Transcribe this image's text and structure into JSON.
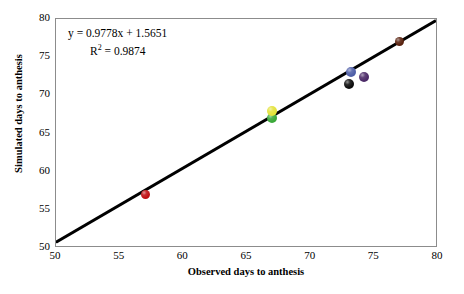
{
  "chart_data": {
    "type": "scatter",
    "title": "",
    "xlabel": "Observed days to anthesis",
    "ylabel": "Simulated days to anthesis",
    "xlim": [
      50,
      80
    ],
    "ylim": [
      50,
      80
    ],
    "xticks": [
      50,
      55,
      60,
      65,
      70,
      75,
      80
    ],
    "yticks": [
      50,
      55,
      60,
      65,
      70,
      75,
      80
    ],
    "grid": false,
    "legend": null,
    "annotations": {
      "equation": "y = 0.9778x + 1.5651",
      "r_squared_prefix": "R",
      "r_squared_sup": "2",
      "r_squared_value": " = 0.9874"
    },
    "fit_line": {
      "slope": 0.9778,
      "intercept": 1.5651,
      "x_start": 50,
      "y_start": 50.5,
      "x_end": 80,
      "y_end": 79.8,
      "color": "#000000",
      "width_px": 3
    },
    "points": [
      {
        "name": "red-point",
        "x": 57.0,
        "y": 57.0,
        "color": "#c00f13",
        "size": 9
      },
      {
        "name": "green-point",
        "x": 67.0,
        "y": 67.0,
        "color": "#3aa838",
        "size": 10
      },
      {
        "name": "yellow-point",
        "x": 67.0,
        "y": 67.9,
        "color": "#e3e23a",
        "size": 10
      },
      {
        "name": "black-point",
        "x": 73.0,
        "y": 71.5,
        "color": "#0d0d0d",
        "size": 10
      },
      {
        "name": "blue-point",
        "x": 73.2,
        "y": 73.1,
        "color": "#4f5fa8",
        "size": 10
      },
      {
        "name": "purple-point",
        "x": 74.2,
        "y": 72.4,
        "color": "#4b2a67",
        "size": 10
      },
      {
        "name": "dark-brown-point",
        "x": 77.0,
        "y": 77.0,
        "color": "#5a2310",
        "size": 9
      }
    ]
  },
  "axes": {
    "x_title": "Observed days to anthesis",
    "y_title": "Simulated days to anthesis",
    "x_tick_labels": [
      "50",
      "55",
      "60",
      "65",
      "70",
      "75",
      "80"
    ],
    "y_tick_labels": [
      "50",
      "55",
      "60",
      "65",
      "70",
      "75",
      "80"
    ]
  },
  "colors": {
    "frame": "#8c8c8c",
    "text": "#000000",
    "line": "#000000"
  }
}
